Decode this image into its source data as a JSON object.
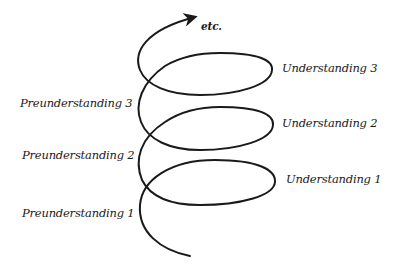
{
  "diagram": {
    "type": "hermeneutic-spiral",
    "arrow_label": "etc.",
    "left_labels": [
      {
        "text": "Preunderstanding 3",
        "level": 3
      },
      {
        "text": "Preunderstanding 2",
        "level": 2
      },
      {
        "text": "Preunderstanding 1",
        "level": 1
      }
    ],
    "right_labels": [
      {
        "text": "Understanding 3",
        "level": 3
      },
      {
        "text": "Understanding 2",
        "level": 2
      },
      {
        "text": "Understanding 1",
        "level": 1
      }
    ],
    "colors": {
      "stroke": "#1a1a1a",
      "background": "#ffffff"
    }
  }
}
